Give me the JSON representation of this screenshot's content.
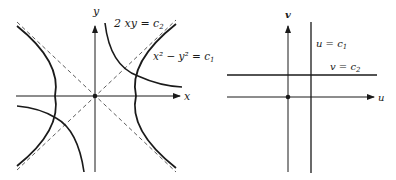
{
  "left_panel": {
    "axes": {
      "x_label": "x",
      "y_label": "y"
    },
    "curve_labels": {
      "xy_family": {
        "prefix": "2 xy = c",
        "subscript": "2"
      },
      "hyperbola_family": {
        "text": "x² − y² = c",
        "subscript": "1"
      }
    },
    "origin_marker": "dot"
  },
  "right_panel": {
    "axes": {
      "u_label": "u",
      "v_label": "v"
    },
    "line_labels": {
      "vertical": {
        "prefix": "u = c",
        "subscript": "1"
      },
      "horizontal": {
        "prefix": "v = c",
        "subscript": "2"
      }
    },
    "origin_marker": "dot"
  },
  "colors": {
    "stroke": "#1a1a1a",
    "background": "#ffffff"
  }
}
